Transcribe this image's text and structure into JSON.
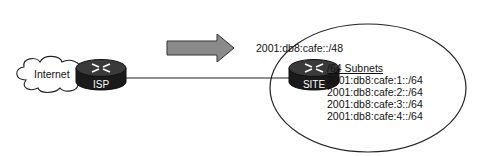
{
  "diagram": {
    "cloud": {
      "label": "Internet",
      "icon": "cloud-icon"
    },
    "routers": [
      {
        "id": "isp",
        "label": "ISP",
        "icon": "router-icon"
      },
      {
        "id": "site",
        "label": "SITE",
        "icon": "router-icon"
      }
    ],
    "arrow": {
      "icon": "arrow-right-icon",
      "fill": "#8a8a8a",
      "stroke": "#333333"
    },
    "site_prefix": "2001:db8:cafe::/48",
    "subnets": {
      "title": "/64 Subnets",
      "items": [
        "2001:db8:cafe:1::/64",
        "2001:db8:cafe:2::/64",
        "2001:db8:cafe:3::/64",
        "2001:db8:cafe:4::/64"
      ]
    },
    "colors": {
      "router_body": "#1a1a1a",
      "router_top": "#3a3a3a",
      "line": "#222222"
    }
  }
}
